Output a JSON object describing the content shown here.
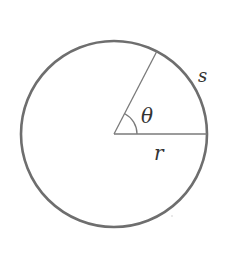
{
  "diagram": {
    "type": "circle-sector-arc-length",
    "colors": {
      "background": "#ffffff",
      "circle_stroke": "#6e6e6e",
      "line_stroke": "#7a7a7a",
      "label": "#333333"
    },
    "circle": {
      "cx": 114,
      "cy": 134,
      "r": 93
    },
    "radius_horizontal": {
      "x1": 114,
      "y1": 134,
      "x2": 207,
      "y2": 134
    },
    "radius_angled": {
      "x1": 114,
      "y1": 134,
      "x2": 157,
      "y2": 51
    },
    "angle_arc": {
      "r": 23,
      "start_deg": 0,
      "end_deg": 62
    },
    "labels": {
      "angle": "θ",
      "arc_length": "s",
      "radius": "r"
    }
  }
}
